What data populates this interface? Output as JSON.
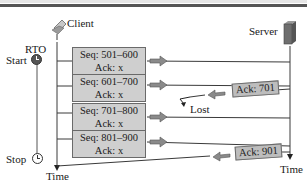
{
  "diagram": {
    "title_bar": "",
    "client": {
      "label": "Client",
      "icon": "laptop-icon"
    },
    "server": {
      "label": "Server",
      "icon": "server-icon"
    },
    "rto": {
      "label": "RTO",
      "start_label": "Start",
      "stop_label": "Stop",
      "icon": "clock-icon"
    },
    "time_label_client": "Time",
    "time_label_server": "Time",
    "segments": [
      {
        "seq": "Seq: 501–600",
        "ack": "Ack: x"
      },
      {
        "seq": "Seq: 601–700",
        "ack": "Ack: x"
      },
      {
        "seq": "Seq: 701–800",
        "ack": "Ack: x"
      },
      {
        "seq": "Seq: 801–900",
        "ack": "Ack: x"
      }
    ],
    "acks": [
      {
        "label": "Ack: 701",
        "status": "Lost"
      },
      {
        "label": "Ack: 901",
        "status": ""
      }
    ],
    "colors": {
      "segment_fill": "#cfcfcf",
      "ack_fill": "#bdbdbd",
      "line": "#3a3a3a",
      "arrow": "#7a7a7a",
      "server_body": "#6e6e6e"
    }
  }
}
